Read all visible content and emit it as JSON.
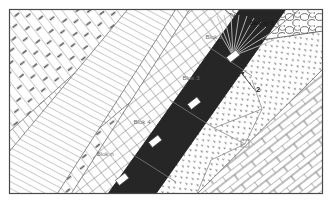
{
  "figure": {
    "frame_color": "#4a4a4a",
    "background_color": "#ffffff"
  },
  "seam": {
    "name": "coal-seam-band",
    "fill_color": "#262626",
    "description": "dark inclined seam band running from upper-right to lower-left"
  },
  "blocks": [
    {
      "id": "block-1",
      "label": "Blok nr 1",
      "x": 262,
      "y": 25,
      "text_color": "#111111"
    },
    {
      "id": "block-2",
      "label": "Blok 2",
      "x": 214,
      "y": 39,
      "text_color": "#5f5f5f"
    },
    {
      "id": "block-3",
      "label": "Blok 3",
      "x": 191,
      "y": 80,
      "text_color": "#6e6e6e"
    },
    {
      "id": "block-4",
      "label": "Blok 4",
      "x": 142,
      "y": 124,
      "text_color": "#6e6e6e"
    },
    {
      "id": "block-n",
      "label": "Blok n",
      "x": 105,
      "y": 156,
      "text_color": "#6e6e6e"
    }
  ],
  "annotations": [
    {
      "id": "annotation-2",
      "label": "2",
      "x": 258,
      "y": 92
    }
  ],
  "markers": [
    {
      "id": "marker-1",
      "cx": 233,
      "cy": 56,
      "w": 11,
      "h": 6,
      "rot": -38
    },
    {
      "id": "marker-2",
      "cx": 194,
      "cy": 103,
      "w": 11,
      "h": 6,
      "rot": -38
    },
    {
      "id": "marker-3",
      "cx": 155,
      "cy": 141,
      "w": 11,
      "h": 6,
      "rot": -38
    },
    {
      "id": "marker-4",
      "cx": 122,
      "cy": 179,
      "w": 11,
      "h": 6,
      "rot": -38
    }
  ],
  "lithology_zones": [
    {
      "id": "zone-shale-hatch-dash",
      "pattern": "diagonal-hatch-with-dashes",
      "position": "upper-left"
    },
    {
      "id": "zone-diagonal-hatch",
      "pattern": "dense-diagonal-hatch",
      "position": "upper-left-middle"
    },
    {
      "id": "zone-cross-hatch",
      "pattern": "cross-hatch-grid",
      "position": "middle-left-of-seam"
    },
    {
      "id": "zone-conglomerate",
      "pattern": "cobble-circles",
      "position": "top-right"
    },
    {
      "id": "zone-stipple",
      "pattern": "dotted-stipple",
      "position": "right-of-seam"
    },
    {
      "id": "zone-brick",
      "pattern": "brick-masonry",
      "position": "bottom-right"
    }
  ],
  "fan": {
    "id": "blast-fan",
    "description": "radial fan of drill-hole lines",
    "origin_x": 233,
    "origin_y": 56,
    "ray_count": 11,
    "color": "#c8c8c8"
  }
}
